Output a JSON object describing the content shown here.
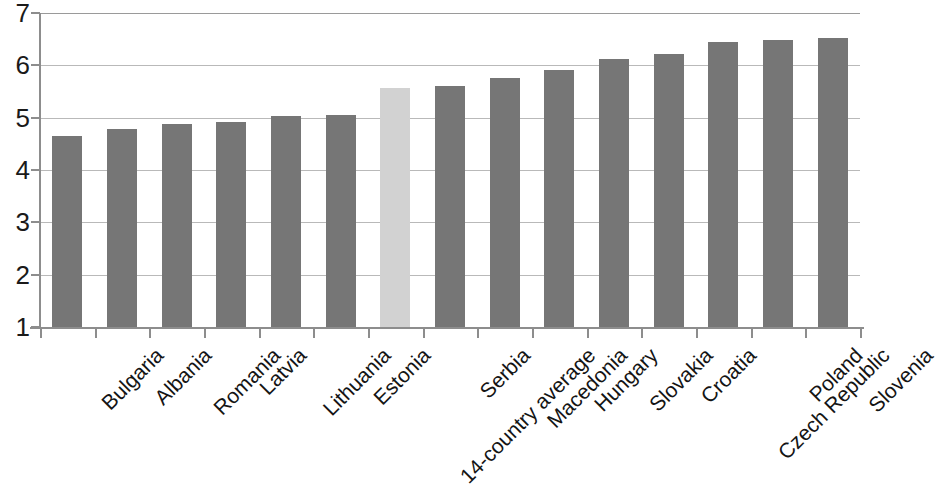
{
  "chart_data": {
    "type": "bar",
    "title": "",
    "subtitle": "",
    "xlabel": "",
    "ylabel": "",
    "categories": [
      "Bulgaria",
      "Albania",
      "Romania",
      "Latvia",
      "Lithuania",
      "Estonia",
      "14-country average",
      "Serbia",
      "Macedonia",
      "Hungary",
      "Slovakia",
      "Croatia",
      "Czech Republic",
      "Poland",
      "Slovenia"
    ],
    "values": [
      4.65,
      4.78,
      4.88,
      4.92,
      5.03,
      5.05,
      5.57,
      5.6,
      5.75,
      5.91,
      6.12,
      6.22,
      6.45,
      6.48,
      6.52
    ],
    "highlight_index": 6,
    "ylim": [
      1,
      7
    ],
    "yticks": [
      1,
      2,
      3,
      4,
      5,
      6,
      7
    ],
    "ytick_labels": [
      "1",
      "2",
      "3",
      "4",
      "5",
      "6",
      "7"
    ],
    "grid": true,
    "grid_axis": "y",
    "legend": false,
    "legend_position": "none",
    "colors": {
      "bar": "#767676",
      "bar_highlight": "#d2d2d2",
      "gridline": "#b9b9b9",
      "axis": "#8d8d8d",
      "text": "#141414",
      "background": "#ffffff"
    }
  }
}
